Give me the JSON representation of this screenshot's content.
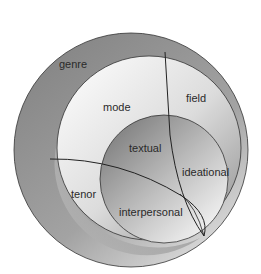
{
  "diagram": {
    "type": "nested-circles",
    "layers": [
      {
        "id": "genre",
        "label": "genre"
      },
      {
        "id": "register",
        "sub_labels": [
          "mode",
          "field",
          "tenor"
        ]
      },
      {
        "id": "language",
        "sub_labels": [
          "textual",
          "ideational",
          "interpersonal"
        ]
      }
    ],
    "labels": {
      "genre": "genre",
      "mode": "mode",
      "field": "field",
      "tenor": "tenor",
      "textual": "textual",
      "ideational": "ideational",
      "interpersonal": "interpersonal"
    },
    "colors": {
      "outer_dark": "#8a8a8a",
      "outer_light": "#c8c8c8",
      "middle_light": "#f2f2f2",
      "middle_dark": "#9a9a9a",
      "inner_dark": "#858585",
      "inner_light": "#f5f5f5",
      "stroke": "#333333"
    }
  }
}
